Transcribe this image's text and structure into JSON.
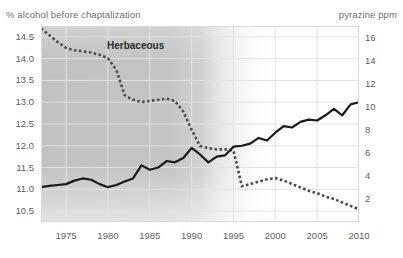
{
  "axis_titles": {
    "left": "% alcohol before chaptalization",
    "right": "pyrazine ppm"
  },
  "annotations": {
    "herbaceous": "Herbaceous"
  },
  "ticks": {
    "left": [
      "14.5",
      "14.0",
      "13.5",
      "13.0",
      "12.5",
      "12.0",
      "11.5",
      "11.0",
      "10.5"
    ],
    "right": [
      "16",
      "14",
      "12",
      "10",
      "8",
      "6",
      "4",
      "2"
    ],
    "x": [
      "1975",
      "1980",
      "1985",
      "1990",
      "1995",
      "2000",
      "2005",
      "2010"
    ]
  },
  "colors": {
    "alcohol_line": "#1a1a1a",
    "pyrazine_line": "#4d4d4d",
    "grid": "#e2e2e2",
    "frame": "#d9d9d9",
    "shade": "#9b9b9b",
    "tick_text": "#5e5e5e",
    "title_text": "#6f6f6f"
  },
  "chart_data": {
    "type": "line",
    "title": "",
    "xlabel": "",
    "ylabel": "% alcohol before chaptalization",
    "y2label": "pyrazine ppm",
    "xlim": [
      1972,
      2010
    ],
    "ylim": [
      10.25,
      14.75
    ],
    "y2lim": [
      0,
      17
    ],
    "grid": true,
    "legend": "none",
    "annotations": [
      {
        "text": "Herbaceous",
        "x": 1980.5,
        "y": 14.05,
        "note": "label inside shaded herbaceous-era band"
      }
    ],
    "shaded_region": {
      "x_start": 1972,
      "x_full_until": 1995,
      "x_fade_end": 2000,
      "description": "grey gradient band fading out after mid-1990s"
    },
    "series": [
      {
        "name": "% alcohol before chaptalization",
        "axis": "left",
        "style": "solid",
        "color": "#1a1a1a",
        "x": [
          1972,
          1973,
          1974,
          1975,
          1976,
          1977,
          1978,
          1979,
          1980,
          1981,
          1982,
          1983,
          1984,
          1985,
          1986,
          1987,
          1988,
          1989,
          1990,
          1991,
          1992,
          1993,
          1994,
          1995,
          1996,
          1997,
          1998,
          1999,
          2000,
          2001,
          2002,
          2003,
          2004,
          2005,
          2006,
          2007,
          2008,
          2009,
          2010
        ],
        "y": [
          11.05,
          11.08,
          11.1,
          11.12,
          11.2,
          11.25,
          11.22,
          11.12,
          11.05,
          11.1,
          11.18,
          11.25,
          11.55,
          11.45,
          11.5,
          11.65,
          11.62,
          11.72,
          11.95,
          11.8,
          11.62,
          11.75,
          11.78,
          11.98,
          12.0,
          12.05,
          12.18,
          12.12,
          12.3,
          12.45,
          12.42,
          12.55,
          12.6,
          12.58,
          12.7,
          12.85,
          12.7,
          12.95,
          13.0
        ]
      },
      {
        "name": "pyrazine ppm",
        "axis": "right",
        "style": "dotted",
        "color": "#4d4d4d",
        "x": [
          1972,
          1973,
          1974,
          1975,
          1976,
          1977,
          1978,
          1979,
          1980,
          1981,
          1982,
          1983,
          1984,
          1985,
          1986,
          1987,
          1988,
          1989,
          1990,
          1991,
          1992,
          1993,
          1994,
          1995,
          1996,
          1997,
          1998,
          1999,
          2000,
          2001,
          2002,
          2003,
          2004,
          2005,
          2006,
          2007,
          2008,
          2009,
          2010
        ],
        "y": [
          16.8,
          16.2,
          15.6,
          15.1,
          14.9,
          14.8,
          14.7,
          14.5,
          14.2,
          13.2,
          11.0,
          10.6,
          10.4,
          10.5,
          10.6,
          10.7,
          10.5,
          9.6,
          8.0,
          6.6,
          6.4,
          6.3,
          6.3,
          6.2,
          3.1,
          3.3,
          3.5,
          3.7,
          3.8,
          3.6,
          3.3,
          3.0,
          2.7,
          2.5,
          2.2,
          2.0,
          1.7,
          1.4,
          1.1
        ]
      }
    ]
  }
}
